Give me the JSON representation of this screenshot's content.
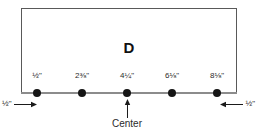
{
  "diagram": {
    "type": "technical-measurement-drawing",
    "part_label": "D",
    "units": "inches",
    "center_callout": {
      "label": "Center",
      "arrow_icon": "arrow-up-icon"
    },
    "edge_margins": {
      "left": {
        "value": "½\"",
        "arrow_icon": "arrow-right-icon"
      },
      "right": {
        "value": "½\"",
        "arrow_icon": "arrow-left-icon"
      }
    },
    "holes": [
      {
        "label": "½\"",
        "x": 37,
        "is_center": false
      },
      {
        "label": "2⅜\"",
        "x": 82,
        "is_center": false
      },
      {
        "label": "4¼\"",
        "x": 127,
        "is_center": true
      },
      {
        "label": "6⅛\"",
        "x": 172,
        "is_center": false
      },
      {
        "label": "8⅛\"",
        "x": 217,
        "is_center": false
      }
    ],
    "colors": {
      "outline": "#595959",
      "edge_line": "#8c8c8c",
      "dot": "#151515",
      "text": "#2b2b2b",
      "background": "#ffffff"
    }
  }
}
